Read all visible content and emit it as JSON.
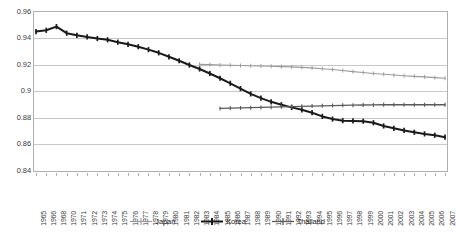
{
  "chart_data": {
    "type": "line",
    "title": "",
    "xlabel": "",
    "ylabel": "",
    "ylim": [
      0.84,
      0.96
    ],
    "ytick_values": [
      0.84,
      0.86,
      0.88,
      0.9,
      0.92,
      0.94,
      0.96
    ],
    "ytick_labels": [
      "0.84",
      "0.86",
      "0.88",
      "0.9",
      "0.92",
      "0.94",
      "0.96"
    ],
    "grid": true,
    "grid_axis": "y",
    "legend_position": "bottom",
    "categories": [
      "1965",
      "1966",
      "1968",
      "1970",
      "1971",
      "1972",
      "1973",
      "1974",
      "1975",
      "1976",
      "1977",
      "1978",
      "1979",
      "1980",
      "1981",
      "1982",
      "1983",
      "1984",
      "1985",
      "1986",
      "1987",
      "1988",
      "1989",
      "1990",
      "1991",
      "1992",
      "1993",
      "1994",
      "1995",
      "1996",
      "1997",
      "1998",
      "1999",
      "2000",
      "2001",
      "2002",
      "2003",
      "2004",
      "2005",
      "2006",
      "2007"
    ],
    "series": [
      {
        "name": "Japan",
        "color": "#9a9a9a",
        "marker": "plus",
        "line_width": 1.1,
        "values": [
          null,
          null,
          null,
          null,
          null,
          null,
          null,
          null,
          null,
          null,
          null,
          null,
          null,
          null,
          null,
          null,
          0.9205,
          0.9203,
          0.92,
          0.9198,
          0.9196,
          0.9194,
          0.9192,
          0.919,
          0.9188,
          0.9186,
          0.9182,
          0.9178,
          0.9172,
          0.9166,
          0.9158,
          0.915,
          0.9143,
          0.9136,
          0.913,
          0.9124,
          0.9119,
          0.9114,
          0.911,
          0.9105,
          0.91
        ]
      },
      {
        "name": "Korea",
        "color": "#1a1a1a",
        "marker": "plus",
        "line_width": 2.0,
        "values": [
          0.9452,
          0.9462,
          0.949,
          0.944,
          0.9424,
          0.9412,
          0.94,
          0.939,
          0.9372,
          0.9356,
          0.9338,
          0.9316,
          0.9292,
          0.9262,
          0.9232,
          0.92,
          0.917,
          0.9136,
          0.91,
          0.9062,
          0.9022,
          0.8982,
          0.895,
          0.8922,
          0.89,
          0.888,
          0.8862,
          0.884,
          0.8812,
          0.8792,
          0.878,
          0.8778,
          0.8776,
          0.8764,
          0.874,
          0.8722,
          0.8706,
          0.8692,
          0.868,
          0.867,
          0.8655
        ]
      },
      {
        "name": "Thailand",
        "color": "#595959",
        "marker": "plus",
        "line_width": 1.3,
        "values": [
          null,
          null,
          null,
          null,
          null,
          null,
          null,
          null,
          null,
          null,
          null,
          null,
          null,
          null,
          null,
          null,
          null,
          null,
          0.8872,
          0.8874,
          0.8876,
          0.8878,
          0.888,
          0.8882,
          0.8884,
          0.8886,
          0.8888,
          0.889,
          0.8892,
          0.8894,
          0.8896,
          0.8897,
          0.8898,
          0.8899,
          0.89,
          0.89,
          0.89,
          0.89,
          0.89,
          0.89,
          0.89
        ]
      }
    ]
  },
  "legend": {
    "items": [
      {
        "label": "Japan"
      },
      {
        "label": "Korea"
      },
      {
        "label": "Thailand"
      }
    ]
  },
  "colors": {
    "japan": "#9a9a9a",
    "korea": "#1a1a1a",
    "thailand": "#595959",
    "gridline": "#c8c8c8",
    "frame": "#b0b0b0",
    "tick_text": "#3a3a3a",
    "background": "#ffffff"
  }
}
